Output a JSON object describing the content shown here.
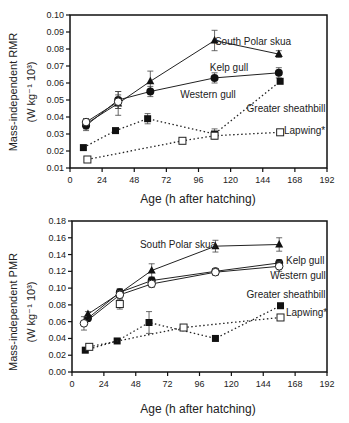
{
  "chart_data": [
    {
      "type": "line",
      "title": "",
      "xlabel": "Age (h after hatching)",
      "ylabel": "Mass-independent RMR",
      "ylabel_units": "(W kg⁻¹ 10³)",
      "xlim": [
        0,
        192
      ],
      "ylim": [
        0.01,
        0.1
      ],
      "xticks": [
        "0",
        "24",
        "48",
        "72",
        "96",
        "120",
        "144",
        "168",
        "192"
      ],
      "yticks": [
        "0.01",
        "0.02",
        "0.03",
        "0.04",
        "0.05",
        "0.06",
        "0.07",
        "0.08",
        "0.09",
        "0.10"
      ],
      "grid": false,
      "series": [
        {
          "name": "South Polar skua",
          "marker": "filled-triangle",
          "line": "solid",
          "x": [
            12,
            36,
            60,
            108,
            156
          ],
          "values": [
            0.036,
            0.048,
            0.061,
            0.085,
            0.077
          ],
          "err": [
            0.003,
            0.007,
            0.006,
            0.006,
            0.002
          ]
        },
        {
          "name": "Kelp gull",
          "marker": "filled-circle",
          "line": "solid",
          "x": [
            12,
            36,
            60,
            108,
            156
          ],
          "values": [
            0.035,
            0.05,
            0.055,
            0.063,
            0.066
          ],
          "err": [
            0.003,
            0.005,
            0.003,
            0.003,
            0.003
          ]
        },
        {
          "name": "Western gull",
          "marker": "open-circle",
          "line": "solid",
          "x": [
            12,
            36
          ],
          "values": [
            0.037,
            0.049
          ],
          "err": [
            0.002,
            0.004
          ]
        },
        {
          "name": "Greater sheathbill",
          "marker": "filled-square",
          "line": "dotted",
          "x": [
            10,
            34,
            58,
            108,
            157
          ],
          "values": [
            0.022,
            0.032,
            0.039,
            0.03,
            0.061
          ],
          "err": [
            0,
            0.001,
            0.003,
            0.003,
            0
          ]
        },
        {
          "name": "Lapwing*",
          "marker": "open-square",
          "line": "dotted",
          "x": [
            13,
            84,
            108,
            157
          ],
          "values": [
            0.015,
            0.026,
            0.029,
            0.031
          ],
          "err": [
            0,
            0,
            0,
            0
          ]
        }
      ]
    },
    {
      "type": "line",
      "title": "",
      "xlabel": "Age (h after hatching)",
      "ylabel": "Mass-independent PMR",
      "ylabel_units": "(W kg⁻¹ 10³)",
      "xlim": [
        0,
        192
      ],
      "ylim": [
        0.0,
        0.18
      ],
      "xticks": [
        "0",
        "24",
        "48",
        "72",
        "96",
        "120",
        "144",
        "168",
        "192"
      ],
      "yticks": [
        "0.00",
        "0.02",
        "0.04",
        "0.06",
        "0.08",
        "0.10",
        "0.12",
        "0.14",
        "0.16",
        "0.18"
      ],
      "grid": false,
      "series": [
        {
          "name": "South Polar skua",
          "marker": "filled-triangle",
          "line": "solid",
          "x": [
            12,
            36,
            60,
            108,
            156
          ],
          "values": [
            0.069,
            0.094,
            0.121,
            0.15,
            0.152
          ],
          "err": [
            0.003,
            0.005,
            0.008,
            0.007,
            0.008
          ]
        },
        {
          "name": "Kelp gull",
          "marker": "filled-circle",
          "line": "solid",
          "x": [
            12,
            36,
            60,
            108,
            156
          ],
          "values": [
            0.064,
            0.095,
            0.109,
            0.12,
            0.13
          ],
          "err": [
            0.003,
            0.004,
            0.004,
            0.003,
            0.004
          ]
        },
        {
          "name": "Western gull",
          "marker": "open-circle",
          "line": "solid",
          "x": [
            9,
            36,
            60,
            108,
            156
          ],
          "values": [
            0.058,
            0.092,
            0.105,
            0.119,
            0.126
          ],
          "err": [
            0.008,
            0.005,
            0.004,
            0.004,
            0.006
          ]
        },
        {
          "name": "Greater sheathbill",
          "marker": "filled-square",
          "line": "dotted",
          "x": [
            10,
            34,
            58,
            108,
            157
          ],
          "values": [
            0.026,
            0.037,
            0.059,
            0.04,
            0.079
          ],
          "err": [
            0,
            0,
            0.013,
            0,
            0
          ]
        },
        {
          "name": "Lapwing*",
          "marker": "open-square",
          "line": "dotted",
          "x": [
            13,
            84,
            157
          ],
          "values": [
            0.03,
            0.053,
            0.065
          ],
          "err": [
            0,
            0,
            0
          ]
        },
        {
          "name": "Lapwing-extra",
          "marker": "open-square",
          "line": "solid",
          "x": [
            36
          ],
          "values": [
            0.081
          ],
          "err": [
            0.006
          ]
        }
      ]
    }
  ],
  "labels": {
    "top": {
      "ylabel": "Mass-independent RMR",
      "ylabel_units": "(W kg⁻¹ 10³)",
      "xlabel": "Age (h after hatching)",
      "skua": "South Polar skua",
      "kelp": "Kelp gull",
      "western": "Western gull",
      "sheathbill": "Greater sheathbill",
      "lapwing": "Lapwing*"
    },
    "bottom": {
      "ylabel": "Mass-independent PMR",
      "ylabel_units": "(W kg⁻¹ 10³)",
      "xlabel": "Age (h after hatching)",
      "skua": "South Polar skua",
      "kelp": "Kelp gull",
      "western": "Western gull",
      "sheathbill": "Greater sheathbill",
      "lapwing": "Lapwing*"
    }
  }
}
